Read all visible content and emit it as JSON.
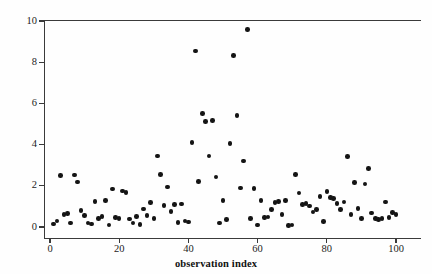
{
  "chart_data": {
    "type": "scatter",
    "title": "",
    "xlabel": "observation index",
    "ylabel": "",
    "xlim": [
      -2,
      107
    ],
    "ylim": [
      -0.35,
      10.1
    ],
    "grid": false,
    "legend": null,
    "marker": "filled-circle",
    "marker_color": "#141414",
    "xticks": [
      0,
      20,
      40,
      60,
      80,
      100
    ],
    "xtick_labels": [
      "0",
      "20",
      "40",
      "60",
      "80",
      "100"
    ],
    "yticks": [
      0,
      2,
      4,
      6,
      8,
      10
    ],
    "ytick_labels": [
      "0",
      "2",
      "4",
      "6",
      "8",
      "10"
    ],
    "x": [
      1,
      2,
      3,
      4,
      5,
      6,
      7,
      8,
      9,
      10,
      11,
      12,
      13,
      14,
      15,
      16,
      17,
      18,
      19,
      20,
      21,
      22,
      23,
      24,
      25,
      26,
      27,
      28,
      29,
      30,
      31,
      32,
      33,
      34,
      35,
      36,
      37,
      38,
      39,
      40,
      41,
      42,
      43,
      44,
      45,
      46,
      47,
      48,
      49,
      50,
      51,
      52,
      53,
      54,
      55,
      56,
      57,
      58,
      59,
      60,
      61,
      62,
      63,
      64,
      65,
      66,
      67,
      68,
      69,
      70,
      71,
      72,
      73,
      74,
      75,
      76,
      77,
      78,
      79,
      80,
      81,
      82,
      83,
      84,
      85,
      86,
      87,
      88,
      89,
      90,
      91,
      92,
      93,
      94,
      95,
      96,
      97,
      98,
      99,
      100
    ],
    "y": [
      0.15,
      0.3,
      2.5,
      0.6,
      0.65,
      0.2,
      2.52,
      2.18,
      0.8,
      0.55,
      0.2,
      0.15,
      1.25,
      0.4,
      0.5,
      1.28,
      0.1,
      1.85,
      0.45,
      0.4,
      1.75,
      1.68,
      0.38,
      0.2,
      0.5,
      0.12,
      0.88,
      0.55,
      1.18,
      0.42,
      3.45,
      2.55,
      1.05,
      1.95,
      0.75,
      1.1,
      0.22,
      1.12,
      0.3,
      0.25,
      4.1,
      8.55,
      2.2,
      5.5,
      5.12,
      3.45,
      5.18,
      2.43,
      0.2,
      1.28,
      0.35,
      4.05,
      8.32,
      5.4,
      1.9,
      3.2,
      9.6,
      0.42,
      1.88,
      0.1,
      1.3,
      0.45,
      0.48,
      0.85,
      1.2,
      1.25,
      0.62,
      1.3,
      0.08,
      0.1,
      2.55,
      1.65,
      1.1,
      1.15,
      1.02,
      0.72,
      0.85,
      1.48,
      0.27,
      1.72,
      1.42,
      1.38,
      1.15,
      0.85,
      1.22,
      3.42,
      0.62,
      2.15,
      0.9,
      0.42,
      2.08,
      2.85,
      0.68,
      0.4,
      0.35,
      0.42,
      1.22,
      0.45,
      0.7,
      0.62
    ]
  },
  "figure": {
    "axis_color": "#3a3a3a",
    "background": "#ffffff",
    "point_color": "#141414"
  }
}
